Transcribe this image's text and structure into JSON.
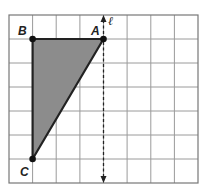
{
  "diagram": {
    "grid": {
      "cols": 8,
      "rows": 7,
      "line_color": "#9a9a9a",
      "border_color": "#777777"
    },
    "triangle": {
      "fill": "#8c8c8c",
      "stroke": "#222222",
      "vertices": [
        {
          "name": "A",
          "col": 4,
          "row": 1
        },
        {
          "name": "B",
          "col": 1,
          "row": 1
        },
        {
          "name": "C",
          "col": 1,
          "row": 6
        }
      ]
    },
    "line_l": {
      "label": "ℓ",
      "col": 4,
      "style": "dashed, arrows both ends"
    },
    "labels": {
      "A": "A",
      "B": "B",
      "C": "C",
      "l": "ℓ"
    }
  }
}
